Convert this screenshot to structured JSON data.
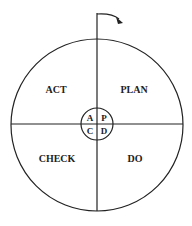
{
  "diagram": {
    "quadrants": {
      "top_left": "ACT",
      "top_right": "PLAN",
      "bottom_left": "CHECK",
      "bottom_right": "DO"
    },
    "center": {
      "top_left": "A",
      "top_right": "P",
      "bottom_left": "C",
      "bottom_right": "D"
    },
    "arrow": "clockwise-rotation-arrow",
    "colors": {
      "stroke": "#222222",
      "background": "#ffffff"
    }
  }
}
